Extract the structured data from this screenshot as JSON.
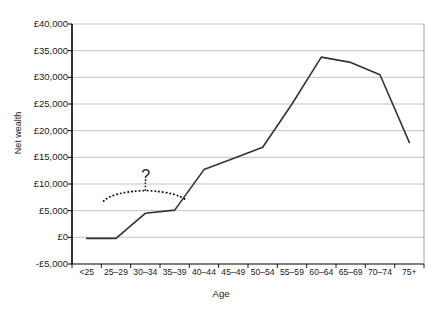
{
  "chart_data": {
    "type": "line",
    "title": "",
    "xlabel": "Age",
    "ylabel": "Net wealth",
    "categories": [
      "<25",
      "25–29",
      "30–34",
      "35–39",
      "40–44",
      "45–49",
      "50–54",
      "55–59",
      "60–64",
      "65–69",
      "70–74",
      "75+"
    ],
    "values": [
      -200,
      -200,
      4500,
      5100,
      12700,
      14800,
      16900,
      25000,
      33800,
      32800,
      30500,
      17800
    ],
    "series": [
      {
        "name": "Net wealth",
        "values": [
          -200,
          -200,
          4500,
          5100,
          12700,
          14800,
          16900,
          25000,
          33800,
          32800,
          30500,
          17800
        ]
      }
    ],
    "ylim": [
      -5000,
      40000
    ],
    "ytick_labels": [
      "£40,000",
      "£35,000",
      "£30,000",
      "£25,000",
      "£20,000",
      "£15,000",
      "£10,000",
      "£5,000",
      "£0",
      "-£5,000"
    ],
    "ytick_values": [
      40000,
      35000,
      30000,
      25000,
      20000,
      15000,
      10000,
      5000,
      0,
      -5000
    ],
    "grid": true,
    "legend": "none",
    "line_color": "#333333",
    "grid_color": "#b5b5b5",
    "axis_color": "#000000",
    "annotations": [
      {
        "name": "question-mark",
        "text": "?",
        "x_category_start": "25–29",
        "x_category_end": "35–39",
        "y_value": 11500
      },
      {
        "name": "dotted-brace",
        "text": "",
        "x_category_start": "25–29",
        "x_category_end": "35–39",
        "y_value": 8500
      }
    ]
  }
}
